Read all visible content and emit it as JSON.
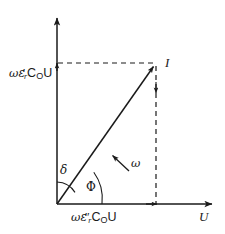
{
  "diagram": {
    "type": "phasor-diagram",
    "background_color": "#ffffff",
    "stroke_color": "#1a1a1a",
    "axes": {
      "vertical": {
        "name": "imaginary-axis",
        "label": "",
        "quantity_label": {
          "full_text": "ωε'ᵣCₒU",
          "omega": "ω",
          "epsilon": "ε",
          "prime": "′",
          "epsilon_subscript": "r",
          "capacitance": "C",
          "capacitance_subscript": "O",
          "voltage": "U"
        }
      },
      "horizontal": {
        "name": "real-axis",
        "label": "U",
        "quantity_label": {
          "full_text": "ωε″ᵣCₒU",
          "omega": "ω",
          "epsilon": "ε",
          "prime": "″",
          "epsilon_subscript": "r",
          "capacitance": "C",
          "capacitance_subscript": "O",
          "voltage": "U"
        }
      }
    },
    "vectors": [
      {
        "name": "total-current-phasor",
        "label": "I",
        "origin": [
          57,
          204
        ],
        "tip": [
          156,
          63
        ]
      }
    ],
    "angles": [
      {
        "name": "loss-angle",
        "label": "δ",
        "between": [
          "imaginary-axis",
          "total-current-phasor"
        ],
        "arc_radius": 22
      },
      {
        "name": "phase-angle",
        "label": "Φ",
        "between": [
          "total-current-phasor",
          "real-axis"
        ],
        "arc_radius": 45
      }
    ],
    "annotations": [
      {
        "name": "angular-frequency-rotation",
        "label": "ω",
        "arrow_from": [
          129,
          171
        ],
        "arrow_to": [
          111,
          154
        ]
      }
    ],
    "construction_lines": [
      {
        "name": "horizontal-projection-dashed",
        "style": "dashed",
        "from": [
          57,
          63
        ],
        "to": [
          156,
          63
        ]
      },
      {
        "name": "vertical-projection-dashed",
        "style": "dashed",
        "from": [
          156,
          63
        ],
        "to": [
          156,
          204
        ]
      }
    ]
  }
}
